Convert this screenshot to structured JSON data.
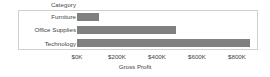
{
  "chart_data": {
    "type": "bar",
    "orientation": "horizontal",
    "title": "",
    "header_label": "Category",
    "categories": [
      "Furniture",
      "Office Supplies",
      "Technology"
    ],
    "values": [
      110000,
      495000,
      865000
    ],
    "xlabel": "Gross Profit",
    "ylabel": "Category",
    "xlim": [
      0,
      900000
    ],
    "xticks": [
      0,
      200000,
      400000,
      600000,
      800000
    ],
    "xtick_labels": [
      "$0K",
      "$200K",
      "$400K",
      "$600K",
      "$800K"
    ],
    "grid": false,
    "legend": null,
    "bar_color": "#808080",
    "frame_color": "#d0d0d0",
    "text_color": "#3f3f3f",
    "background": "#ffffff"
  }
}
